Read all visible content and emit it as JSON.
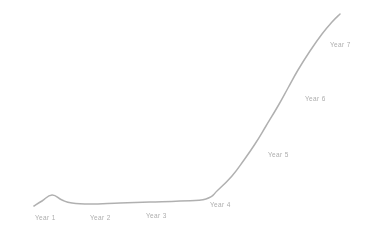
{
  "chart_data": {
    "type": "line",
    "title": "",
    "subtitle": "",
    "xlabel": "",
    "ylabel": "",
    "grid": false,
    "legend": "none",
    "axes_visible": false,
    "line_color": "#a8a8a8",
    "background_color": "#ffffff",
    "label_color": "#9a9a9a",
    "categories": [
      "Year 1",
      "Year 2",
      "Year 3",
      "Year 4",
      "Year 5",
      "Year 6",
      "Year 7"
    ],
    "values": [
      5,
      4,
      5,
      8,
      30,
      62,
      96
    ],
    "xlim": [
      0,
      7.6
    ],
    "ylim": [
      0,
      100
    ],
    "series": [
      {
        "name": "Growth",
        "values": [
          5,
          4,
          5,
          8,
          30,
          62,
          96
        ]
      }
    ],
    "annotations": [
      {
        "text": "Year 1",
        "x": 35,
        "y": 215
      },
      {
        "text": "Year 2",
        "x": 90,
        "y": 215
      },
      {
        "text": "Year 3",
        "x": 146,
        "y": 213
      },
      {
        "text": "Year 4",
        "x": 210,
        "y": 202
      },
      {
        "text": "Year 5",
        "x": 268,
        "y": 152
      },
      {
        "text": "Year 6",
        "x": 305,
        "y": 96
      },
      {
        "text": "Year 7",
        "x": 330,
        "y": 42
      }
    ],
    "path_points": [
      [
        34,
        206
      ],
      [
        42,
        201
      ],
      [
        52,
        195
      ],
      [
        62,
        200
      ],
      [
        72,
        203
      ],
      [
        90,
        204
      ],
      [
        120,
        203
      ],
      [
        150,
        202
      ],
      [
        180,
        201
      ],
      [
        206,
        199
      ],
      [
        218,
        190
      ],
      [
        232,
        176
      ],
      [
        244,
        160
      ],
      [
        255,
        144
      ],
      [
        266,
        126
      ],
      [
        278,
        106
      ],
      [
        288,
        88
      ],
      [
        298,
        70
      ],
      [
        310,
        51
      ],
      [
        322,
        34
      ],
      [
        332,
        22
      ],
      [
        340,
        14
      ]
    ]
  },
  "labels": {
    "year1": "Year 1",
    "year2": "Year 2",
    "year3": "Year 3",
    "year4": "Year 4",
    "year5": "Year 5",
    "year6": "Year 6",
    "year7": "Year 7"
  },
  "colors": {
    "line": "#a8a8a8",
    "label": "#9a9a9a",
    "background": "#ffffff"
  }
}
